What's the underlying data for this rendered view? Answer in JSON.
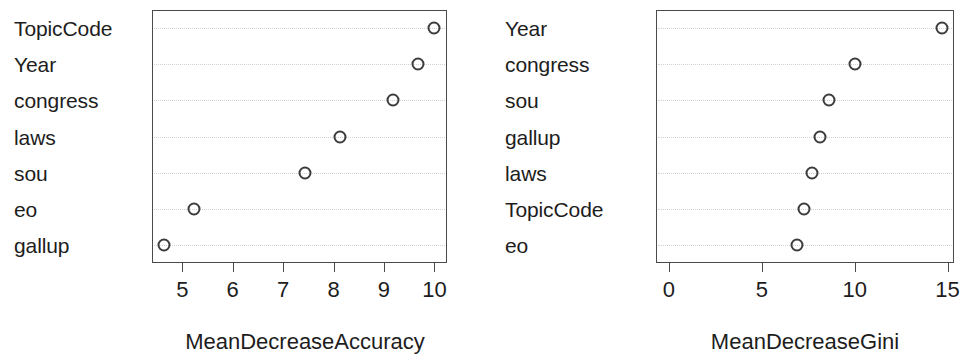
{
  "figure": {
    "title": "",
    "background_color": "#ffffff",
    "point_color": "#3c3c3c",
    "axis_color": "#4a4a4a",
    "text_color": "#1d1d1d"
  },
  "chart_data": [
    {
      "type": "scatter",
      "panel": "left",
      "title": "",
      "xlabel": "MeanDecreaseAccuracy",
      "ylabel": "",
      "categories": [
        "TopicCode",
        "Year",
        "congress",
        "laws",
        "sou",
        "eo",
        "gallup"
      ],
      "values": [
        10.0,
        9.67,
        9.18,
        8.12,
        7.43,
        5.23,
        4.64
      ],
      "xlim": [
        4.4,
        10.25
      ],
      "xticks": [
        5,
        6,
        7,
        8,
        9,
        10
      ],
      "xticklabels": [
        "5",
        "6",
        "7",
        "8",
        "9",
        "10"
      ],
      "grid": true,
      "grid_style": "dotted",
      "legend": "none",
      "marker": "open-circle"
    },
    {
      "type": "scatter",
      "panel": "right",
      "title": "",
      "xlabel": "MeanDecreaseGini",
      "ylabel": "",
      "categories": [
        "Year",
        "congress",
        "sou",
        "gallup",
        "laws",
        "TopicCode",
        "eo"
      ],
      "values": [
        14.68,
        10.02,
        8.64,
        8.15,
        7.69,
        7.26,
        6.9
      ],
      "xlim": [
        -0.7,
        15.35
      ],
      "xticks": [
        0,
        5,
        10,
        15
      ],
      "xticklabels": [
        "0",
        "5",
        "10",
        "15"
      ],
      "grid": true,
      "grid_style": "dotted",
      "legend": "none",
      "marker": "open-circle"
    }
  ],
  "left_panel": {
    "axis_title": "MeanDecreaseAccuracy",
    "labels": [
      "TopicCode",
      "Year",
      "congress",
      "laws",
      "sou",
      "eo",
      "gallup"
    ],
    "tick_labels": [
      "5",
      "6",
      "7",
      "8",
      "9",
      "10"
    ]
  },
  "right_panel": {
    "axis_title": "MeanDecreaseGini",
    "labels": [
      "Year",
      "congress",
      "sou",
      "gallup",
      "laws",
      "TopicCode",
      "eo"
    ],
    "tick_labels": [
      "0",
      "5",
      "10",
      "15"
    ]
  }
}
